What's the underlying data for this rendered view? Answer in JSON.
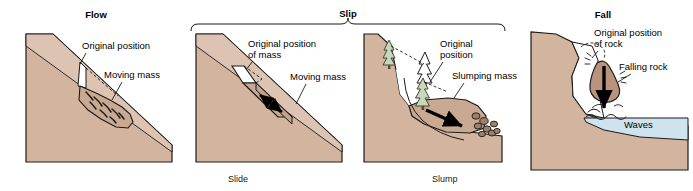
{
  "figure": {
    "width": 693,
    "height": 191,
    "background": "#ffffff"
  },
  "colors": {
    "terrain": "#d3b49f",
    "terrain_light": "#ddc3b1",
    "terrain_shadow": "#c4a28c",
    "rock_fill": "#b9937c",
    "water": "#cfe3ee",
    "tree_green": "#5f7f4f",
    "tree_light": "#c9d8bc",
    "outline": "#1a1a1a",
    "text": "#000000",
    "white": "#ffffff"
  },
  "panels": [
    {
      "id": "flow",
      "heading": "Flow",
      "caption": "",
      "labels": [
        {
          "name": "original-position",
          "text": "Original position"
        },
        {
          "name": "moving-mass",
          "text": "Moving mass"
        }
      ]
    },
    {
      "id": "slide",
      "heading": "",
      "caption": "Slide",
      "labels": [
        {
          "name": "original-position-of-mass",
          "line1": "Original position",
          "line2": "of mass"
        },
        {
          "name": "moving-mass",
          "text": "Moving mass"
        }
      ]
    },
    {
      "id": "slump",
      "heading": "",
      "caption": "Slump",
      "labels": [
        {
          "name": "original-position",
          "line1": "Original",
          "line2": "position"
        },
        {
          "name": "slumping-mass",
          "text": "Slumping mass"
        }
      ]
    },
    {
      "id": "fall",
      "heading": "Fall",
      "caption": "",
      "labels": [
        {
          "name": "original-position-of-rock",
          "line1": "Original position",
          "line2": "of rock"
        },
        {
          "name": "falling-rock",
          "text": "Falling rock"
        },
        {
          "name": "waves",
          "text": "Waves"
        }
      ]
    }
  ],
  "group_bracket": {
    "name": "slip-group",
    "heading": "Slip",
    "spans": [
      "Slide",
      "Slump"
    ]
  }
}
